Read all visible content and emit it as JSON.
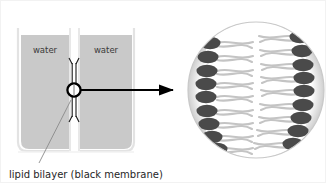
{
  "figure": {
    "title_label": "lipid bilayer (black membrane)",
    "caption": "lipid bilayer (black membrane)",
    "left_chamber_label": "water",
    "right_chamber_label": "water",
    "aperture_label": "aperture",
    "arrow_label": "magnification-arrow",
    "detail_label": "bilayer detail",
    "colors": {
      "water_fill": "#c9c9c9",
      "water_fill_light": "#d0d0d0",
      "beaker_outline": "#e8e8e8",
      "beaker_wall": "#f0f0f0",
      "membrane_black": "#000000",
      "detail_circle_fill": "#d4d4d4",
      "detail_interior_fill": "#ffffff",
      "lipid_head": "#4a4a4a",
      "lipid_tail": "#c2c2c2",
      "caption_color": "#262626",
      "background": "#ffffff"
    },
    "geometry": {
      "beaker_left": 14,
      "beaker_right": 137,
      "beaker_top": 26,
      "beaker_bottom": 152,
      "septum_x": 73,
      "aperture_cx": 73,
      "aperture_cy": 89,
      "aperture_r": 7,
      "arrow_start_x": 81,
      "arrow_end_x": 176,
      "arrow_y": 89,
      "detail_cx": 255,
      "detail_cy": 89,
      "detail_r": 69
    },
    "lipid_counts": {
      "left_heads": 9,
      "right_heads": 9,
      "total_lipids": 18
    },
    "lipid_head_rows_left_y": [
      42,
      56,
      70,
      83,
      96,
      110,
      123,
      136,
      148
    ],
    "lipid_head_rows_right_y": [
      36,
      50,
      64,
      77,
      90,
      104,
      117,
      130,
      143
    ]
  }
}
